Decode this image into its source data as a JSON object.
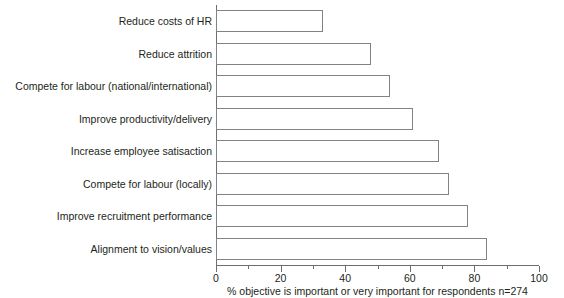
{
  "chart_data": {
    "type": "bar",
    "orientation": "horizontal",
    "title": "",
    "subtitle": "",
    "xlabel": "% objective is important or very important for respondents n=274",
    "ylabel": "",
    "xlim": [
      0,
      100
    ],
    "xticks": [
      0,
      20,
      40,
      60,
      80,
      100
    ],
    "xtick_labels": [
      "0",
      "20",
      "40",
      "60",
      "80",
      "100"
    ],
    "minor_xticks": [
      10,
      30,
      50,
      70,
      90
    ],
    "grid": false,
    "legend": false,
    "bar_style": {
      "fill": "#ffffff",
      "edge": "#808285"
    },
    "categories": [
      "Reduce costs of HR",
      "Reduce attrition",
      "Compete for labour (national/international)",
      "Improve productivity/delivery",
      "Increase employee satisaction",
      "Compete for labour (locally)",
      "Improve recruitment performance",
      "Alignment to vision/values"
    ],
    "values": [
      33,
      48,
      54,
      61,
      69,
      72,
      78,
      84
    ]
  },
  "axis": {
    "caption": "% objective is important or very important for respondents n=274"
  }
}
